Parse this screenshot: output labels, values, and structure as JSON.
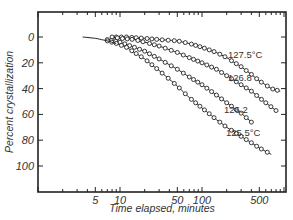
{
  "chart_data": {
    "type": "line",
    "title": "",
    "xlabel": "Time elapsed,  minutes",
    "ylabel": "Percent  crystallization",
    "xscale": "log",
    "xlim": [
      1,
      1050
    ],
    "ylim": [
      -19,
      120
    ],
    "y_inverted": true,
    "grid": false,
    "legend": "inline labels at curve ends",
    "x_tick_labels": [
      "5",
      "10",
      "50",
      "100",
      "500"
    ],
    "x_tick_values": [
      5,
      10,
      50,
      100,
      500
    ],
    "y_tick_labels": [
      "0",
      "20",
      "40",
      "60",
      "80",
      "100"
    ],
    "y_tick_values": [
      0,
      20,
      40,
      60,
      80,
      100
    ],
    "series": [
      {
        "name": "127.5°C",
        "label": "127.5°C",
        "marker": "open-circle",
        "x": [
          9,
          12,
          15,
          20,
          30,
          50,
          70,
          100,
          150,
          200,
          300,
          400,
          500,
          700,
          900
        ],
        "y": [
          0,
          0,
          0.5,
          1,
          2,
          3,
          5,
          8,
          12,
          16,
          23,
          29,
          34,
          40,
          42
        ]
      },
      {
        "name": "126.8",
        "label": "126.8",
        "marker": "open-circle",
        "x": [
          8,
          10,
          15,
          20,
          30,
          50,
          70,
          100,
          150,
          200,
          300,
          400,
          500,
          600,
          800
        ],
        "y": [
          0,
          1,
          2,
          4,
          7,
          12,
          16,
          20,
          25,
          30,
          37,
          42,
          47,
          51,
          57
        ]
      },
      {
        "name": "126.2",
        "label": "126.2",
        "marker": "open-circle",
        "x": [
          7,
          10,
          15,
          20,
          30,
          50,
          70,
          100,
          150,
          200,
          300,
          400
        ],
        "y": [
          2,
          4,
          8,
          11,
          17,
          25,
          31,
          37,
          45,
          51,
          59,
          66
        ]
      },
      {
        "name": "125.5°C",
        "label": "125.5°C",
        "marker": "open-circle",
        "x": [
          7,
          9,
          12,
          15,
          20,
          30,
          50,
          70,
          100,
          150,
          200,
          300,
          400,
          500,
          700
        ],
        "y": [
          3,
          5,
          8,
          12,
          17,
          26,
          38,
          47,
          55,
          64,
          70,
          77,
          82,
          86,
          91
        ]
      },
      {
        "name": "initial-curve",
        "label": "",
        "marker": "none",
        "x": [
          3.5,
          5,
          7,
          9
        ],
        "y": [
          0,
          1,
          3,
          5
        ]
      }
    ]
  }
}
